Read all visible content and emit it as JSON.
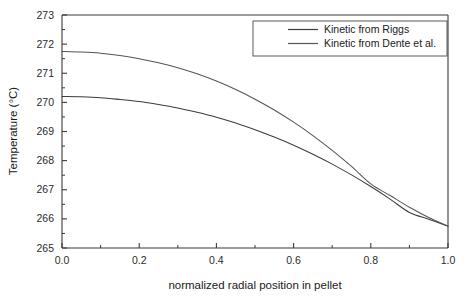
{
  "chart_data": {
    "type": "line",
    "title": "",
    "xlabel": "normalized radial position in pellet",
    "ylabel": "Temperature (°C)",
    "xlim": [
      0.0,
      1.0
    ],
    "ylim": [
      265,
      273
    ],
    "grid": false,
    "legend_position": "top-right",
    "xticks": [
      "0.0",
      "0.2",
      "0.4",
      "0.6",
      "0.8",
      "1.0"
    ],
    "xtick_values": [
      0.0,
      0.2,
      0.4,
      0.6,
      0.8,
      1.0
    ],
    "yticks": [
      "265",
      "266",
      "267",
      "268",
      "269",
      "270",
      "271",
      "272",
      "273"
    ],
    "ytick_values": [
      265,
      266,
      267,
      268,
      269,
      270,
      271,
      272,
      273
    ],
    "x": [
      0.0,
      0.05,
      0.1,
      0.15,
      0.2,
      0.25,
      0.3,
      0.35,
      0.4,
      0.45,
      0.5,
      0.55,
      0.6,
      0.65,
      0.7,
      0.75,
      0.8,
      0.85,
      0.9,
      0.95,
      1.0
    ],
    "series": [
      {
        "name": "Kinetic from Riggs",
        "color": "#3c3c3c",
        "values": [
          270.2,
          270.19,
          270.16,
          270.1,
          270.03,
          269.93,
          269.81,
          269.66,
          269.49,
          269.29,
          269.06,
          268.81,
          268.53,
          268.22,
          267.88,
          267.51,
          267.11,
          266.68,
          266.22,
          265.99,
          265.75
        ]
      },
      {
        "name": "Kinetic from Dente et al.",
        "color": "#555555",
        "values": [
          271.75,
          271.73,
          271.69,
          271.61,
          271.5,
          271.36,
          271.19,
          270.98,
          270.73,
          270.44,
          270.11,
          269.74,
          269.32,
          268.86,
          268.35,
          267.8,
          267.2,
          266.8,
          266.4,
          266.05,
          265.75
        ]
      }
    ]
  },
  "legend": {
    "items": [
      {
        "label": "Kinetic from Riggs"
      },
      {
        "label": "Kinetic from Dente et al."
      }
    ]
  },
  "axes": {
    "x_title": "normalized radial position in pellet",
    "y_title": "Temperature (°C)"
  }
}
